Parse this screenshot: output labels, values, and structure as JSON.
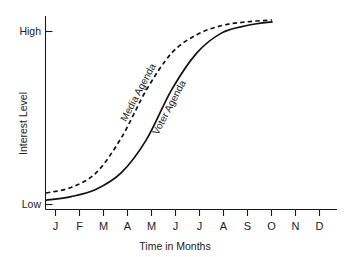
{
  "chart_data": {
    "type": "line",
    "title": "",
    "xlabel": "Time in Months",
    "ylabel": "Interest Level",
    "grid": false,
    "legend_position": "inline-curve-labels",
    "categories": [
      "J",
      "F",
      "M",
      "A",
      "M",
      "J",
      "J",
      "A",
      "S",
      "O",
      "N",
      "D"
    ],
    "ytick_labels": [
      "Low",
      "High"
    ],
    "ylim_labels": {
      "min": "Low",
      "max": "High"
    },
    "axis_color": "#1a1a1a",
    "series": [
      {
        "name": "Media Agenda",
        "style": "dashed",
        "color": "#111111",
        "x": [
          "J",
          "F",
          "M",
          "A",
          "M",
          "J",
          "J",
          "A",
          "S",
          "O"
        ],
        "values": [
          0.06,
          0.09,
          0.17,
          0.36,
          0.62,
          0.82,
          0.92,
          0.97,
          0.99,
          1.0
        ]
      },
      {
        "name": "Voter Agenda",
        "style": "solid",
        "color": "#111111",
        "x": [
          "J",
          "F",
          "M",
          "A",
          "M",
          "J",
          "J",
          "A",
          "S",
          "O"
        ],
        "values": [
          0.02,
          0.04,
          0.08,
          0.17,
          0.35,
          0.62,
          0.82,
          0.93,
          0.97,
          0.99
        ]
      }
    ]
  },
  "axes": {
    "y_title": "Interest Level",
    "x_title": "Time in Months",
    "y_high_label": "High",
    "y_low_label": "Low"
  },
  "months": {
    "m0": "J",
    "m1": "F",
    "m2": "M",
    "m3": "A",
    "m4": "M",
    "m5": "J",
    "m6": "J",
    "m7": "A",
    "m8": "S",
    "m9": "O",
    "m10": "N",
    "m11": "D"
  },
  "series_labels": {
    "media": "Media Agenda",
    "voter": "Voter Agenda"
  }
}
